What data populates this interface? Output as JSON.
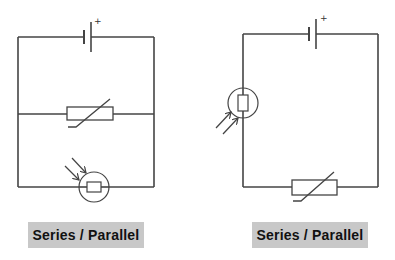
{
  "colors": {
    "wire": "#444444",
    "label_bg": "#c8c8c8",
    "label_text": "#111111",
    "background": "#ffffff"
  },
  "circuits": [
    {
      "id": "circuit-a",
      "description": "Cell with thermistor branch in parallel with light-dependent resistor branch",
      "components": [
        "cell",
        "thermistor",
        "ldr"
      ],
      "cell": {
        "polarity_symbol": "+"
      },
      "label": "Series / Parallel"
    },
    {
      "id": "circuit-b",
      "description": "Cell, light-dependent resistor and thermistor in a single loop",
      "components": [
        "cell",
        "ldr",
        "thermistor"
      ],
      "cell": {
        "polarity_symbol": "+"
      },
      "label": "Series / Parallel"
    }
  ]
}
